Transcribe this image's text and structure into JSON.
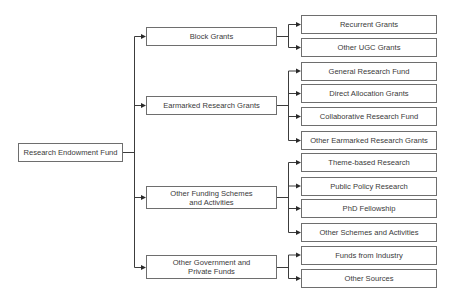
{
  "diagram": {
    "root": {
      "label": "Research Endowment Fund"
    },
    "branches": [
      {
        "label": "Block Grants",
        "children": [
          "Recurrent Grants",
          "Other UGC Grants"
        ]
      },
      {
        "label": "Earmarked Research Grants",
        "children": [
          "General Research Fund",
          "Direct Allocation Grants",
          "Collaborative Research Fund",
          "Other Earmarked Research Grants"
        ]
      },
      {
        "label": "Other Funding Schemes\nand Activities",
        "children": [
          "Theme-based Research",
          "Public Policy Research",
          "PhD Fellowship",
          "Other Schemes and Activities"
        ]
      },
      {
        "label": "Other Government and\nPrivate Funds",
        "children": [
          "Funds from Industry",
          "Other Sources"
        ]
      }
    ],
    "colors": {
      "box_border": "#6e6e6e",
      "line": "#3c3c3c",
      "text": "#3a3a3a",
      "background": "#ffffff"
    }
  }
}
